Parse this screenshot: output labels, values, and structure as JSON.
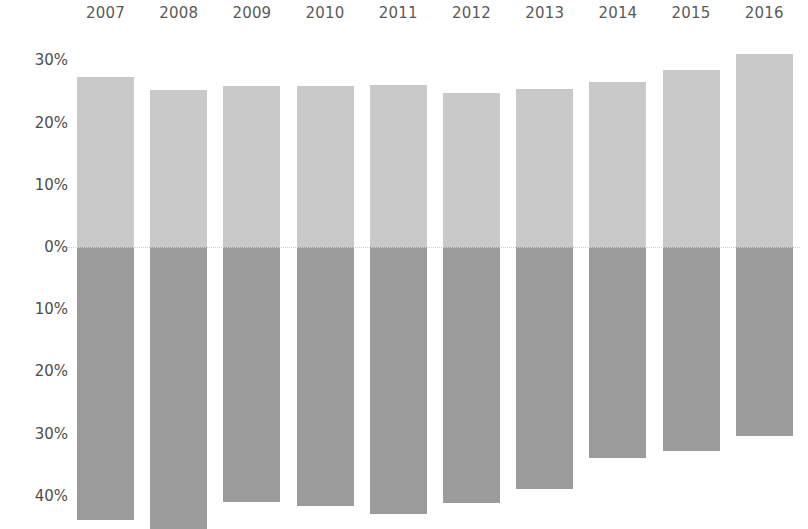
{
  "chart_data": {
    "type": "bar",
    "title": "",
    "subtitle": "",
    "xlabel": "",
    "ylabel": "",
    "orientation": "vertical",
    "stacked": false,
    "diverging": true,
    "grid": false,
    "legend_position": "none",
    "categories": [
      "2007",
      "2008",
      "2009",
      "2010",
      "2011",
      "2012",
      "2013",
      "2014",
      "2015",
      "2016"
    ],
    "y_tick_labels": [
      "30%",
      "20%",
      "10%",
      "0%",
      "10%",
      "20%",
      "30%",
      "40%"
    ],
    "y_tick_values": [
      30,
      20,
      10,
      0,
      -10,
      -20,
      -30,
      -40
    ],
    "ylim": [
      -45,
      33
    ],
    "series": [
      {
        "name": "positive",
        "color": "#c9c9c9",
        "values": [
          27.3,
          25.2,
          25.9,
          25.9,
          26.0,
          24.8,
          25.4,
          26.5,
          28.5,
          31.0
        ]
      },
      {
        "name": "negative",
        "color": "#9b9b9b",
        "values": [
          -43.9,
          -45.3,
          -41.0,
          -41.6,
          -42.9,
          -41.2,
          -38.9,
          -33.9,
          -32.8,
          -30.4
        ]
      }
    ],
    "colors": {
      "positive_bar": "#c9c9c9",
      "negative_bar": "#9b9b9b",
      "zero_line": "#cfcfcf",
      "tick_text": "#4d4d4d",
      "year_text": "#5a5a5a",
      "background": "#ffffff"
    }
  }
}
